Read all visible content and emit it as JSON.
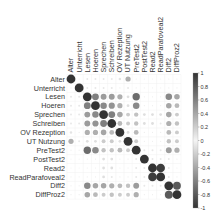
{
  "chart_data": {
    "type": "heatmap",
    "subtype": "corrplot-circle",
    "title": "",
    "variables": [
      "Alter",
      "Unterricht",
      "Lesen",
      "Hoeren",
      "Sprechen",
      "Schreiben",
      "OV Rezeption",
      "UT Nutzung",
      "PreTest2",
      "PostTest2",
      "Read2",
      "ReadParafoveal2",
      "Diff2",
      "DiffProz2"
    ],
    "matrix": [
      [
        1.0,
        0.02,
        0.05,
        0.05,
        0.05,
        0.05,
        0.08,
        0.35,
        0.02,
        0.0,
        0.0,
        0.0,
        0.02,
        0.02
      ],
      [
        0.02,
        1.0,
        0.05,
        0.05,
        0.05,
        0.05,
        0.02,
        0.05,
        0.02,
        0.0,
        0.0,
        0.0,
        0.02,
        0.02
      ],
      [
        0.05,
        0.05,
        1.0,
        0.6,
        0.45,
        0.45,
        0.35,
        0.1,
        0.7,
        0.02,
        0.02,
        0.02,
        0.55,
        0.4
      ],
      [
        0.05,
        0.05,
        0.6,
        1.0,
        0.55,
        0.5,
        0.35,
        0.1,
        0.55,
        0.02,
        0.02,
        0.02,
        0.4,
        0.3
      ],
      [
        0.05,
        0.05,
        0.45,
        0.55,
        1.0,
        0.6,
        0.4,
        0.2,
        0.25,
        0.1,
        0.1,
        0.1,
        0.4,
        0.2
      ],
      [
        0.05,
        0.05,
        0.45,
        0.5,
        0.6,
        1.0,
        0.3,
        0.2,
        0.25,
        0.1,
        0.1,
        0.05,
        0.35,
        0.25
      ],
      [
        0.08,
        0.02,
        0.35,
        0.35,
        0.4,
        0.3,
        1.0,
        0.1,
        0.3,
        0.02,
        0.02,
        0.02,
        0.3,
        0.2
      ],
      [
        0.35,
        0.05,
        0.1,
        0.1,
        0.2,
        0.2,
        0.1,
        1.0,
        0.2,
        0.02,
        0.02,
        0.02,
        0.25,
        0.2
      ],
      [
        0.02,
        0.02,
        0.7,
        0.55,
        0.25,
        0.25,
        0.3,
        0.2,
        1.0,
        0.05,
        0.05,
        0.05,
        0.45,
        0.35
      ],
      [
        0.0,
        0.0,
        0.02,
        0.02,
        0.1,
        0.1,
        0.02,
        0.02,
        0.05,
        1.0,
        0.05,
        0.05,
        0.05,
        0.02
      ],
      [
        0.0,
        0.0,
        0.02,
        0.02,
        0.1,
        0.1,
        0.02,
        0.02,
        0.05,
        0.05,
        1.0,
        0.95,
        0.05,
        0.02
      ],
      [
        0.0,
        0.0,
        0.02,
        0.02,
        0.1,
        0.05,
        0.02,
        0.02,
        0.05,
        0.05,
        0.95,
        1.0,
        0.05,
        0.02
      ],
      [
        0.02,
        0.02,
        0.55,
        0.4,
        0.4,
        0.35,
        0.3,
        0.25,
        0.45,
        0.05,
        0.05,
        0.05,
        1.0,
        0.8
      ],
      [
        0.02,
        0.02,
        0.4,
        0.3,
        0.2,
        0.25,
        0.2,
        0.2,
        0.35,
        0.02,
        0.02,
        0.02,
        0.8,
        1.0
      ]
    ],
    "colorbar": {
      "ticks": [
        "1",
        "0.8",
        "0.6",
        "0.4",
        "0.2",
        "0",
        "-0.2",
        "-0.4",
        "-0.6",
        "-0.8",
        "-1"
      ],
      "range": [
        -1,
        1
      ],
      "colors": {
        "high": "#333333",
        "mid": "#f2f2f2",
        "low": "#333333"
      }
    },
    "legend_position": "right",
    "grid": true
  }
}
